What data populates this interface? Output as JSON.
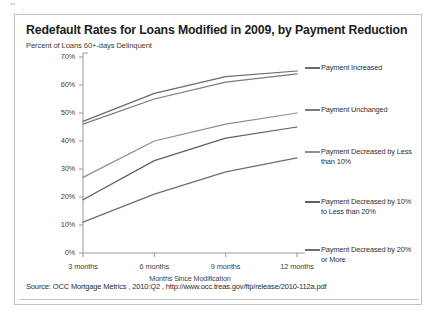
{
  "header": {
    "title": "Redefault Rates for Loans Modified in 2009, by Payment Reduction",
    "subtitle": "Percent of Loans 60+-days Delinquent"
  },
  "source": {
    "text": "Source: OCC Mortgage Metrics , 2010:Q2 , http://www.occ.treas.gov/ftp/release/2010-112a.pdf"
  },
  "axis": {
    "y_ticks": [
      "70%",
      "60%",
      "50%",
      "40%",
      "30%",
      "20%",
      "10%",
      "0%"
    ],
    "x_ticks": [
      "3 months",
      "6 months",
      "9 months",
      "12 months"
    ],
    "x_title": "Months Since Modification"
  },
  "legend": {
    "items": [
      {
        "label": "Payment Increased",
        "color": "#6b6b6b"
      },
      {
        "label": "Payment Unchanged",
        "color": "#7a7a7a"
      },
      {
        "label": "Payment Decreased by Less than 10%",
        "color": "#8e8e8e"
      },
      {
        "label": "Payment Decreased by 10% to Less than 20%",
        "color": "#5f5f5f"
      },
      {
        "label": "Payment Decreased by 20% or More",
        "color": "#6e6e6e"
      }
    ]
  },
  "chart_data": {
    "type": "line",
    "title": "Redefault Rates for Loans Modified in 2009, by Payment Reduction",
    "subtitle": "Percent of Loans 60+-days Delinquent",
    "xlabel": "Months Since Modification",
    "ylabel": "Percent of Loans 60+-days Delinquent",
    "categories": [
      "3 months",
      "6 months",
      "9 months",
      "12 months"
    ],
    "x": [
      3,
      6,
      9,
      12
    ],
    "ylim": [
      0,
      70
    ],
    "ytick_values": [
      0,
      10,
      20,
      30,
      40,
      50,
      60,
      70
    ],
    "ytick_format": "percent",
    "grid": false,
    "legend_position": "right",
    "series": [
      {
        "name": "Payment Increased",
        "color": "#6b6b6b",
        "values": [
          47,
          57,
          63,
          65
        ]
      },
      {
        "name": "Payment Unchanged",
        "color": "#7a7a7a",
        "values": [
          46,
          55,
          61,
          64
        ]
      },
      {
        "name": "Payment Decreased by Less than 10%",
        "color": "#8e8e8e",
        "values": [
          27,
          40,
          46,
          50
        ]
      },
      {
        "name": "Payment Decreased by 10% to Less than 20%",
        "color": "#5f5f5f",
        "values": [
          19,
          33,
          41,
          45
        ]
      },
      {
        "name": "Payment Decreased by 20% or More",
        "color": "#6e6e6e",
        "values": [
          11,
          21,
          29,
          34
        ]
      }
    ]
  }
}
